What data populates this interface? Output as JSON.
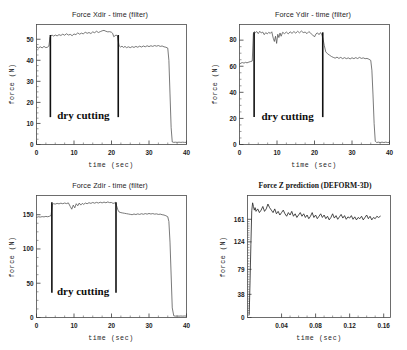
{
  "figure": {
    "background_color": "#ffffff",
    "line_color": "#4d4d4d",
    "axis_color": "#3a3a3a",
    "annotation_color": "#111111",
    "panel_count": 4
  },
  "chart_data": [
    {
      "id": "force-xdir",
      "type": "line",
      "title": "Force Xdir - time  (filter)",
      "xlabel": "time  (sec)",
      "ylabel": "force  (N)",
      "xlim": [
        0,
        40
      ],
      "ylim": [
        0,
        57
      ],
      "xticks": [
        0,
        10,
        20,
        30,
        40
      ],
      "xtick_labels": [
        "0",
        "10",
        "20",
        "30",
        "40"
      ],
      "yticks": [
        0,
        10,
        20,
        30,
        40,
        50
      ],
      "ytick_labels": [
        "0",
        "10",
        "20",
        "30",
        "40",
        "50"
      ],
      "grid": false,
      "legend": "none",
      "annotations": [
        {
          "text": "dry cutting",
          "x": 12.5,
          "y": 12,
          "kind": "text"
        },
        {
          "kind": "vline",
          "x": 3.7,
          "y0": 13,
          "y1": 52
        },
        {
          "kind": "vline",
          "x": 21.8,
          "y0": 13,
          "y1": 52
        }
      ],
      "x": [
        0,
        0.5,
        1,
        1.5,
        2,
        2.5,
        3,
        3.3,
        3.6,
        3.9,
        4.2,
        4.6,
        5,
        5.5,
        6,
        6.5,
        7,
        7.5,
        8,
        8.5,
        9,
        9.5,
        10,
        10.5,
        11,
        11.5,
        12,
        12.5,
        13,
        13.5,
        14,
        14.5,
        15,
        15.5,
        16,
        16.5,
        17,
        17.5,
        18,
        18.5,
        19,
        19.5,
        20,
        20.3,
        20.6,
        20.9,
        21.2,
        21.6,
        22,
        22.4,
        22.8,
        23.2,
        23.6,
        24,
        24.5,
        25,
        25.5,
        26,
        26.5,
        27,
        27.5,
        28,
        28.5,
        29,
        29.5,
        30,
        30.5,
        31,
        31.5,
        32,
        32.5,
        33,
        33.5,
        34,
        34.5,
        35,
        35.3,
        35.6,
        35.9,
        36.2,
        36.6,
        37,
        37.5,
        38,
        38.5,
        39,
        39.5,
        40
      ],
      "y": [
        46.5,
        45.8,
        46.4,
        45.9,
        46.6,
        46.0,
        46.3,
        46.8,
        50.8,
        51.8,
        51.9,
        51.5,
        52.0,
        51.6,
        52.2,
        51.8,
        52.4,
        51.9,
        52.6,
        52.0,
        52.3,
        51.7,
        52.5,
        52.2,
        53.0,
        52.4,
        52.9,
        52.5,
        53.4,
        52.8,
        53.2,
        52.7,
        53.5,
        53.1,
        53.8,
        53.2,
        53.6,
        54.0,
        54.2,
        53.8,
        53.5,
        53.6,
        53.3,
        52.8,
        51.2,
        51.6,
        52.0,
        51.6,
        47.0,
        46.3,
        46.7,
        46.1,
        46.6,
        46.0,
        46.4,
        46.0,
        46.5,
        46.1,
        46.6,
        46.2,
        46.7,
        46.3,
        46.8,
        46.4,
        46.9,
        46.5,
        46.9,
        46.6,
        47.0,
        46.7,
        47.0,
        46.6,
        46.8,
        46.4,
        46.2,
        45.8,
        40.0,
        24.0,
        8.0,
        1.2,
        1.0,
        1.1,
        1.0,
        1.1,
        1.0,
        1.1,
        1.0,
        1.0
      ]
    },
    {
      "id": "force-ydir",
      "type": "line",
      "title": "Force Ydir - time  (filter)",
      "xlabel": "time  (sec)",
      "ylabel": "force  (N)",
      "xlim": [
        0,
        40
      ],
      "ylim": [
        0,
        92
      ],
      "xticks": [
        0,
        10,
        20,
        30,
        40
      ],
      "xtick_labels": [
        "0",
        "10",
        "20",
        "30",
        "40"
      ],
      "yticks": [
        0,
        20,
        40,
        60,
        80
      ],
      "ytick_labels": [
        "0",
        "20",
        "40",
        "60",
        "80"
      ],
      "grid": false,
      "legend": "none",
      "annotations": [
        {
          "text": "dry cutting",
          "x": 12.8,
          "y": 19,
          "kind": "text"
        },
        {
          "kind": "vline",
          "x": 3.9,
          "y0": 21,
          "y1": 86
        },
        {
          "kind": "vline",
          "x": 22.2,
          "y0": 21,
          "y1": 86
        }
      ],
      "x": [
        0,
        0.4,
        0.8,
        1.2,
        1.6,
        2,
        2.5,
        3,
        3.4,
        3.7,
        4,
        4.3,
        4.6,
        5,
        5.4,
        5.8,
        6.2,
        6.6,
        7,
        7.4,
        7.8,
        8.2,
        8.6,
        9,
        9.3,
        9.6,
        9.9,
        10.2,
        10.5,
        10.8,
        11.1,
        11.5,
        12,
        12.5,
        13,
        13.5,
        14,
        14.5,
        15,
        15.5,
        16,
        16.5,
        17,
        17.5,
        18,
        18.5,
        19,
        19.5,
        20,
        20.4,
        20.8,
        21.2,
        21.6,
        22,
        22.3,
        22.6,
        23,
        23.5,
        24,
        24.5,
        25,
        25.5,
        26,
        26.5,
        27,
        27.5,
        28,
        28.5,
        29,
        29.5,
        30,
        30.5,
        31,
        31.5,
        32,
        32.5,
        33,
        33.5,
        34,
        34.5,
        35,
        35.3,
        35.6,
        35.9,
        36.2,
        36.6,
        37,
        37.5,
        38,
        38.5,
        39,
        39.5,
        40
      ],
      "y": [
        61.5,
        62.5,
        62.8,
        62.4,
        63.0,
        62.6,
        63.2,
        63.6,
        64.0,
        85.0,
        86.5,
        85.8,
        86.6,
        85.0,
        86.8,
        85.5,
        86.2,
        84.2,
        85.8,
        84.8,
        86.0,
        85.2,
        86.4,
        81.5,
        79.0,
        83.0,
        77.5,
        84.5,
        82.0,
        85.5,
        83.0,
        86.0,
        85.0,
        86.2,
        84.8,
        86.4,
        85.2,
        86.6,
        85.4,
        86.8,
        85.6,
        87.0,
        85.8,
        86.2,
        85.0,
        86.6,
        85.2,
        84.0,
        82.5,
        84.8,
        85.6,
        84.2,
        85.8,
        84.0,
        80.5,
        76.0,
        71.0,
        69.5,
        68.5,
        67.5,
        66.8,
        66.2,
        67.0,
        66.0,
        66.8,
        65.8,
        66.6,
        65.8,
        66.4,
        65.6,
        66.5,
        65.8,
        66.6,
        65.9,
        66.8,
        66.0,
        66.4,
        65.8,
        66.0,
        65.4,
        64.5,
        57.0,
        38.0,
        16.0,
        2.5,
        1.5,
        1.8,
        1.5,
        1.8,
        1.5,
        1.8,
        1.5,
        1.6
      ]
    },
    {
      "id": "force-zdir",
      "type": "line",
      "title": "Force Zdir - time  (filter)",
      "xlabel": "time  (sec)",
      "ylabel": "force  (N)",
      "xlim": [
        0,
        40
      ],
      "ylim": [
        0,
        178
      ],
      "xticks": [
        0,
        10,
        20,
        30,
        40
      ],
      "xtick_labels": [
        "0",
        "10",
        "20",
        "30",
        "40"
      ],
      "yticks": [
        0,
        50,
        100,
        150
      ],
      "ytick_labels": [
        "0",
        "50",
        "100",
        "150"
      ],
      "grid": false,
      "legend": "none",
      "annotations": [
        {
          "text": "dry cutting",
          "x": 12.4,
          "y": 33,
          "kind": "text"
        },
        {
          "kind": "vline",
          "x": 4.1,
          "y0": 36,
          "y1": 168
        },
        {
          "kind": "vline",
          "x": 21.2,
          "y0": 36,
          "y1": 168
        }
      ],
      "x": [
        0,
        0.5,
        1,
        1.5,
        2,
        2.5,
        3,
        3.5,
        3.9,
        4.2,
        4.5,
        5,
        5.5,
        6,
        6.5,
        7,
        7.5,
        8,
        8.5,
        9,
        9.4,
        9.8,
        10.2,
        10.6,
        11,
        11.4,
        11.8,
        12.2,
        12.6,
        13,
        13.5,
        14,
        14.5,
        15,
        15.5,
        16,
        16.5,
        17,
        17.5,
        18,
        18.5,
        19,
        19.5,
        20,
        20.4,
        20.8,
        21,
        21.3,
        21.7,
        22,
        22.5,
        23,
        23.5,
        24,
        24.5,
        25,
        25.5,
        26,
        26.5,
        27,
        27.5,
        28,
        28.5,
        29,
        29.5,
        30,
        30.5,
        31,
        31.5,
        32,
        32.5,
        33,
        33.5,
        34,
        34.5,
        35,
        35.3,
        35.6,
        35.9,
        36.2,
        36.6,
        37,
        37.5,
        38,
        38.5,
        39,
        39.5,
        40
      ],
      "y": [
        146,
        147,
        146.5,
        147.2,
        146.8,
        147.5,
        147,
        147.8,
        149,
        165,
        166,
        165.5,
        166.5,
        165.8,
        166.8,
        166,
        167,
        166.2,
        167.2,
        162,
        158,
        164,
        160,
        166,
        163,
        167,
        164,
        166.5,
        165,
        167,
        166,
        167.5,
        166.5,
        167.8,
        166.8,
        168,
        167,
        168.2,
        167.2,
        168.4,
        167.4,
        168.6,
        167.6,
        167.8,
        166.5,
        167,
        168,
        164,
        157,
        154,
        153,
        152.5,
        152,
        151.5,
        151,
        150.5,
        150,
        151,
        150.2,
        151.2,
        150.4,
        151.4,
        150.6,
        151.6,
        150.8,
        151.8,
        151,
        151.6,
        150.8,
        151.2,
        150.4,
        150.8,
        150,
        149.5,
        148.5,
        147,
        140,
        110,
        62,
        14,
        2.5,
        2,
        2.2,
        2,
        2.2,
        2,
        2.2,
        2
      ]
    },
    {
      "id": "force-z-prediction",
      "type": "line",
      "title": "Force Z prediction (DEFORM-3D)",
      "xlabel": "time  (sec)",
      "ylabel": "force  (N)",
      "xlim": [
        0,
        0.168
      ],
      "ylim": [
        0,
        200
      ],
      "xticks": [
        0.04,
        0.08,
        0.12,
        0.16
      ],
      "xtick_labels": [
        "0.04",
        "0.08",
        "0.12",
        "0.16"
      ],
      "yticks": [
        0,
        38,
        79,
        124,
        161
      ],
      "ytick_labels": [
        "0",
        "38",
        "79",
        "124",
        "161"
      ],
      "grid": false,
      "legend": "none",
      "annotations": [],
      "x": [
        0.002,
        0.003,
        0.004,
        0.005,
        0.006,
        0.007,
        0.008,
        0.009,
        0.01,
        0.012,
        0.014,
        0.016,
        0.018,
        0.02,
        0.022,
        0.024,
        0.026,
        0.028,
        0.03,
        0.032,
        0.034,
        0.036,
        0.038,
        0.04,
        0.042,
        0.044,
        0.046,
        0.048,
        0.05,
        0.052,
        0.054,
        0.056,
        0.058,
        0.06,
        0.062,
        0.064,
        0.066,
        0.068,
        0.07,
        0.072,
        0.074,
        0.076,
        0.078,
        0.08,
        0.082,
        0.084,
        0.086,
        0.088,
        0.09,
        0.092,
        0.094,
        0.096,
        0.098,
        0.1,
        0.102,
        0.104,
        0.106,
        0.108,
        0.11,
        0.112,
        0.114,
        0.116,
        0.118,
        0.12,
        0.122,
        0.124,
        0.126,
        0.128,
        0.13,
        0.132,
        0.134,
        0.136,
        0.138,
        0.14,
        0.142,
        0.144,
        0.146,
        0.148,
        0.15,
        0.152,
        0.154,
        0.156
      ],
      "y": [
        5,
        60,
        120,
        175,
        188,
        182,
        176,
        180,
        174,
        178,
        172,
        176,
        182,
        174,
        178,
        186,
        180,
        176,
        172,
        178,
        170,
        174,
        168,
        172,
        176,
        170,
        166,
        172,
        168,
        174,
        166,
        170,
        164,
        168,
        172,
        166,
        170,
        164,
        168,
        162,
        166,
        172,
        164,
        168,
        162,
        166,
        170,
        164,
        168,
        162,
        166,
        160,
        164,
        170,
        163,
        167,
        161,
        165,
        169,
        163,
        167,
        161,
        165,
        163,
        167,
        161,
        165,
        160,
        164,
        162,
        166,
        160,
        164,
        168,
        162,
        166,
        160,
        164,
        162,
        166,
        164,
        166
      ]
    }
  ]
}
